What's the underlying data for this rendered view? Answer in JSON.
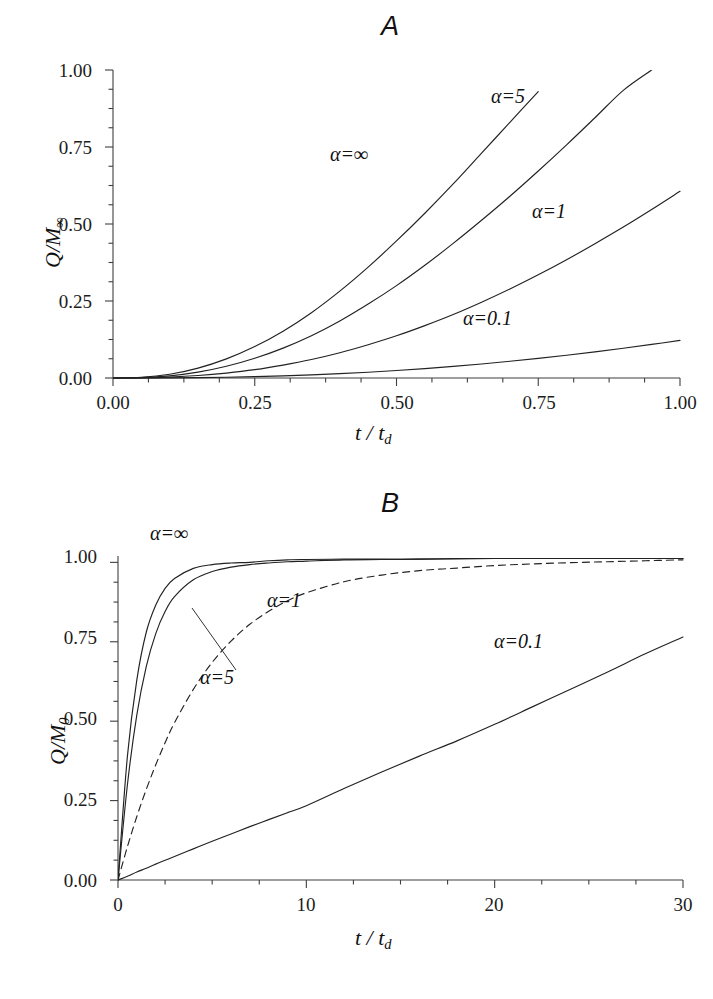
{
  "figure": {
    "panels": [
      {
        "id": "A",
        "title": "A",
        "xlabel_html": "t / t",
        "xlabel_sub": "d",
        "ylabel_main": "Q/M",
        "ylabel_sub": "∞",
        "x_ticks": [
          "0.00",
          "0.25",
          "0.50",
          "0.75",
          "1.00"
        ],
        "y_ticks": [
          "0.00",
          "0.25",
          "0.50",
          "0.75",
          "1.00"
        ],
        "curve_labels": [
          {
            "text": "α=∞"
          },
          {
            "text": "α=5"
          },
          {
            "text": "α=1"
          },
          {
            "text": "α=0.1"
          }
        ]
      },
      {
        "id": "B",
        "title": "B",
        "xlabel_html": "t / t",
        "xlabel_sub": "d",
        "ylabel_main": "Q/M",
        "ylabel_sub": "0",
        "x_ticks": [
          "0",
          "10",
          "20",
          "30"
        ],
        "y_ticks": [
          "0.00",
          "0.25",
          "0.50",
          "0.75",
          "1.00"
        ],
        "curve_labels": [
          {
            "text": "α=∞"
          },
          {
            "text": "α=1"
          },
          {
            "text": "α=5"
          },
          {
            "text": "α=0.1"
          }
        ]
      }
    ]
  },
  "chart_data": [
    {
      "type": "line",
      "title": "A",
      "xlabel": "t / t_d",
      "ylabel": "Q/M_inf",
      "xlim": [
        0,
        1
      ],
      "ylim": [
        0,
        1
      ],
      "xticks": [
        0,
        0.25,
        0.5,
        0.75,
        1.0
      ],
      "yticks": [
        0,
        0.25,
        0.5,
        0.75,
        1.0
      ],
      "xtick_labels": [
        "0.00",
        "0.25",
        "0.50",
        "0.75",
        "1.00"
      ],
      "ytick_labels": [
        "0.00",
        "0.25",
        "0.50",
        "0.75",
        "1.00"
      ],
      "grid": false,
      "minor_ticks": true,
      "legend": "inline-annotations",
      "x": [
        0,
        0.05,
        0.1,
        0.15,
        0.2,
        0.25,
        0.3,
        0.35,
        0.4,
        0.45,
        0.5,
        0.55,
        0.6,
        0.65,
        0.7,
        0.75,
        0.8,
        0.85,
        0.9,
        0.95,
        1.0
      ],
      "series": [
        {
          "name": "α=∞",
          "style": "solid",
          "color": "#222222",
          "clipped_at_top": true,
          "values": [
            0.0,
            0.002,
            0.012,
            0.032,
            0.062,
            0.102,
            0.152,
            0.212,
            0.282,
            0.36,
            0.445,
            0.535,
            0.63,
            0.73,
            0.83,
            0.93,
            null,
            null,
            null,
            null,
            null
          ]
        },
        {
          "name": "α=5",
          "style": "solid",
          "color": "#222222",
          "clipped_at_top": true,
          "values": [
            0.0,
            0.001,
            0.007,
            0.019,
            0.038,
            0.064,
            0.097,
            0.137,
            0.185,
            0.24,
            0.3,
            0.366,
            0.437,
            0.512,
            0.59,
            0.672,
            0.757,
            0.845,
            0.934,
            1.0,
            null
          ]
        },
        {
          "name": "α=1",
          "style": "solid",
          "color": "#222222",
          "values": [
            0.0,
            0.0005,
            0.003,
            0.008,
            0.016,
            0.027,
            0.042,
            0.06,
            0.082,
            0.108,
            0.137,
            0.17,
            0.206,
            0.246,
            0.289,
            0.335,
            0.384,
            0.436,
            0.49,
            0.547,
            0.606
          ]
        },
        {
          "name": "α=0.1",
          "style": "solid",
          "color": "#222222",
          "values": [
            0.0,
            0.0001,
            0.0005,
            0.0013,
            0.0026,
            0.0045,
            0.007,
            0.0102,
            0.0141,
            0.0188,
            0.0243,
            0.0306,
            0.0377,
            0.0456,
            0.0543,
            0.0638,
            0.074,
            0.085,
            0.0967,
            0.109,
            0.122
          ]
        }
      ]
    },
    {
      "type": "line",
      "title": "B",
      "xlabel": "t / t_d",
      "ylabel": "Q/M_0",
      "xlim": [
        0,
        30
      ],
      "ylim": [
        0,
        1.02
      ],
      "xticks": [
        0,
        10,
        20,
        30
      ],
      "yticks": [
        0,
        0.25,
        0.5,
        0.75,
        1.0
      ],
      "xtick_labels": [
        "0",
        "10",
        "20",
        "30"
      ],
      "ytick_labels": [
        "0.00",
        "0.25",
        "0.50",
        "0.75",
        "1.00"
      ],
      "grid": false,
      "minor_ticks": true,
      "legend": "inline-annotations",
      "x": [
        0,
        0.5,
        1,
        1.5,
        2,
        2.5,
        3,
        4,
        5,
        6,
        7,
        8,
        9,
        10,
        12,
        14,
        16,
        18,
        20,
        22,
        24,
        26,
        28,
        30
      ],
      "series": [
        {
          "name": "α=∞",
          "style": "solid",
          "color": "#222222",
          "values": [
            0.0,
            0.39,
            0.63,
            0.78,
            0.865,
            0.918,
            0.949,
            0.981,
            0.993,
            0.998,
            1.0,
            1.005,
            1.008,
            1.009,
            1.01,
            1.01,
            1.01,
            1.012,
            1.012,
            1.012,
            1.012,
            1.012,
            1.012,
            1.012
          ]
        },
        {
          "name": "α=5",
          "style": "solid",
          "color": "#222222",
          "values": [
            0.0,
            0.3,
            0.52,
            0.672,
            0.775,
            0.845,
            0.892,
            0.945,
            0.971,
            0.985,
            0.993,
            0.998,
            1.002,
            1.004,
            1.008,
            1.009,
            1.01,
            1.011,
            1.012,
            1.012,
            1.012,
            1.012,
            1.012,
            1.012
          ]
        },
        {
          "name": "α=1",
          "style": "dashed",
          "color": "#222222",
          "values": [
            0.0,
            0.105,
            0.2,
            0.285,
            0.362,
            0.432,
            0.495,
            0.6,
            0.685,
            0.752,
            0.805,
            0.846,
            0.879,
            0.904,
            0.939,
            0.96,
            0.974,
            0.982,
            0.99,
            0.995,
            0.999,
            1.002,
            1.005,
            1.008
          ]
        },
        {
          "name": "α=0.1",
          "style": "solid",
          "color": "#222222",
          "values": [
            0.0,
            0.012,
            0.025,
            0.037,
            0.05,
            0.062,
            0.074,
            0.098,
            0.122,
            0.145,
            0.168,
            0.19,
            0.212,
            0.234,
            0.288,
            0.34,
            0.39,
            0.438,
            0.49,
            0.545,
            0.6,
            0.655,
            0.712,
            0.765
          ]
        }
      ]
    }
  ]
}
